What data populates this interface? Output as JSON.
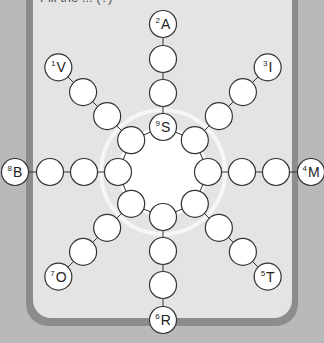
{
  "title": "Fill the ... (?)",
  "center": [
    163,
    172
  ],
  "ring": {
    "radius": 45,
    "node_radius": 13.5,
    "glow_radius": 62
  },
  "spokes": [
    {
      "dir": "up",
      "number": "2",
      "letter": "A"
    },
    {
      "dir": "up-right",
      "number": "3",
      "letter": "I"
    },
    {
      "dir": "right",
      "number": "4",
      "letter": "M"
    },
    {
      "dir": "down-right",
      "number": "5",
      "letter": "T"
    },
    {
      "dir": "down",
      "number": "6",
      "letter": "R"
    },
    {
      "dir": "down-left",
      "number": "7",
      "letter": "O"
    },
    {
      "dir": "left",
      "number": "8",
      "letter": "B"
    },
    {
      "dir": "up-left",
      "number": "1",
      "letter": "V"
    }
  ],
  "ring_label": {
    "number": "9",
    "letter": "S"
  },
  "colors": {
    "background": "#b9b9b9",
    "panel_border": "#8c8c8c",
    "panel": "#e4e4e4",
    "node_fill": "#ffffff",
    "node_stroke": "#333333"
  }
}
